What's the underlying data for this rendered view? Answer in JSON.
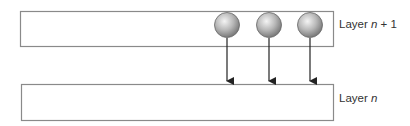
{
  "diagram": {
    "layers": [
      {
        "id": "upper",
        "name_prefix": "Layer ",
        "name_var": "n",
        "name_suffix": " + 1"
      },
      {
        "id": "lower",
        "name_prefix": "Layer ",
        "name_var": "n",
        "name_suffix": ""
      }
    ],
    "nodes": [
      {
        "layer": "upper",
        "shape": "sphere"
      },
      {
        "layer": "upper",
        "shape": "sphere"
      },
      {
        "layer": "upper",
        "shape": "sphere"
      }
    ],
    "edges": [
      {
        "from": "node-1",
        "to": "lower"
      },
      {
        "from": "node-2",
        "to": "lower"
      },
      {
        "from": "node-3",
        "to": "lower"
      }
    ],
    "colors": {
      "box_border": "#8a8a8a",
      "sphere_light": "#f0f0f0",
      "sphere_dark": "#7a7a7a",
      "arrow": "#222222",
      "text": "#333333"
    }
  }
}
